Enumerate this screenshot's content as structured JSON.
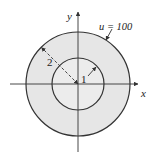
{
  "figure": {
    "outer_region_color": "#e6e6e6",
    "inner_region_color": "#ececec",
    "stroke_color": "#333333",
    "axes": {
      "x_label": "x",
      "y_label": "y"
    },
    "outer_circle": {
      "radius_label": "2",
      "boundary_label": "u = 100"
    },
    "inner_circle": {
      "radius_label": "1"
    }
  }
}
